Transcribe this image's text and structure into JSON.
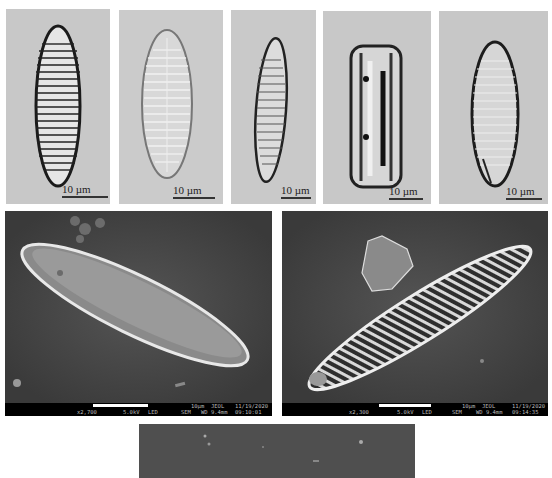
{
  "figure": {
    "lm_panels": [
      {
        "id": "lm-1",
        "scale_label": "10 µm",
        "background": "#c8c8c8",
        "description": "lanceolate valve, dark coarse striae"
      },
      {
        "id": "lm-2",
        "scale_label": "10 µm",
        "background": "#cbcbcb",
        "description": "lanceolate valve, fine pale striae"
      },
      {
        "id": "lm-3",
        "scale_label": "10 µm",
        "background": "#c9c9c9",
        "description": "narrow lanceolate valve, tilted"
      },
      {
        "id": "lm-4",
        "scale_label": "10 µm",
        "background": "#c8c8c8",
        "description": "girdle view, rectangular frustule"
      },
      {
        "id": "lm-5",
        "scale_label": "10 µm",
        "background": "#c7c7c7",
        "description": "lanceolate valve, dark margin"
      }
    ],
    "sem_panels": [
      {
        "id": "sem-1",
        "scale_label": "10µm",
        "magnification": "x2,700",
        "voltage": "5.0kV",
        "detector": "LED",
        "mode": "SEM",
        "brand": "JEOL",
        "wd": "WD 9.4mm",
        "date": "11/19/2020",
        "time": "09:10:01"
      },
      {
        "id": "sem-2",
        "scale_label": "10µm",
        "magnification": "x2,300",
        "voltage": "5.0kV",
        "detector": "LED",
        "mode": "SEM",
        "brand": "JEOL",
        "wd": "WD 9.4mm",
        "date": "11/19/2020",
        "time": "09:14:35"
      }
    ],
    "sem_bottom_partial": {
      "id": "sem-3",
      "background": "#4f4f4f"
    }
  }
}
